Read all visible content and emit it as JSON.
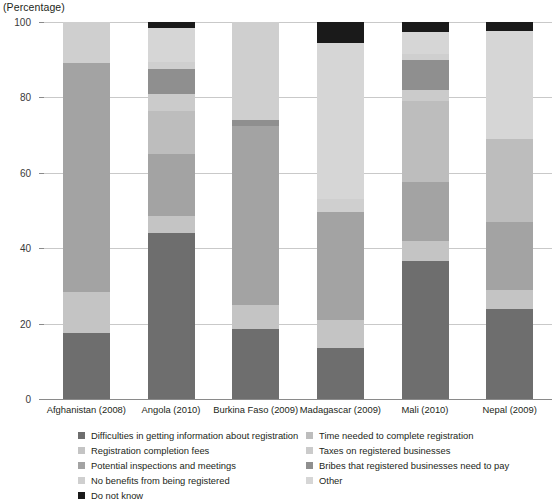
{
  "axis_unit_label": "(Percentage)",
  "legend": {
    "left_column": [
      {
        "label": "Difficulties in getting information about registration",
        "color": "#6e6e6e"
      },
      {
        "label": "Registration completion fees",
        "color": "#c4c4c4"
      },
      {
        "label": "Potential inspections and meetings",
        "color": "#a3a3a3"
      },
      {
        "label": "No benefits from being registered",
        "color": "#cfcfcf"
      },
      {
        "label": "Do not know",
        "color": "#1a1a1a"
      }
    ],
    "right_column": [
      {
        "label": "Time needed to complete registration",
        "color": "#bdbdbd"
      },
      {
        "label": "Taxes on registered businesses",
        "color": "#cbcbcb"
      },
      {
        "label": "Bribes that registered businesses need to pay",
        "color": "#8f8f8f"
      },
      {
        "label": "Other",
        "color": "#d6d6d6"
      }
    ]
  },
  "chart_data": {
    "type": "bar",
    "title": "",
    "subtitle": "",
    "xlabel": "",
    "ylabel": "(Percentage)",
    "ylim": [
      0,
      100
    ],
    "yticks": [
      0,
      20,
      40,
      60,
      80,
      100
    ],
    "grid": true,
    "stacked": true,
    "legend_position": "bottom",
    "categories": [
      "Afghanistan (2008)",
      "Angola (2010)",
      "Burkina Faso (2009)",
      "Madagascar (2009)",
      "Mali (2010)",
      "Nepal (2009)"
    ],
    "series": [
      {
        "name": "Difficulties in getting information about registration",
        "color": "#6e6e6e",
        "values": [
          17.5,
          44.0,
          18.5,
          13.5,
          36.5,
          24.0
        ]
      },
      {
        "name": "Registration completion fees",
        "color": "#c4c4c4",
        "values": [
          11.0,
          4.5,
          6.5,
          7.5,
          5.5,
          5.0
        ]
      },
      {
        "name": "Potential inspections and meetings",
        "color": "#a3a3a3",
        "values": [
          60.5,
          16.5,
          47.5,
          28.5,
          15.5,
          18.0
        ]
      },
      {
        "name": "Time needed to complete registration",
        "color": "#bdbdbd",
        "values": [
          0.0,
          11.5,
          0.0,
          0.0,
          21.5,
          22.0
        ]
      },
      {
        "name": "Taxes on registered businesses",
        "color": "#cbcbcb",
        "values": [
          0.0,
          4.5,
          0.0,
          0.0,
          3.0,
          0.0
        ]
      },
      {
        "name": "Bribes that registered businesses need to pay",
        "color": "#8f8f8f",
        "values": [
          0.0,
          6.5,
          1.5,
          0.0,
          8.0,
          0.0
        ]
      },
      {
        "name": "No benefits from being registered",
        "color": "#cfcfcf",
        "values": [
          11.0,
          2.0,
          26.0,
          3.5,
          1.5,
          0.0
        ]
      },
      {
        "name": "Other",
        "color": "#d6d6d6",
        "values": [
          0.0,
          9.0,
          0.0,
          41.5,
          6.0,
          28.5
        ]
      },
      {
        "name": "Do not know",
        "color": "#1a1a1a",
        "values": [
          0.0,
          1.5,
          0.0,
          5.5,
          2.5,
          2.5
        ]
      }
    ]
  }
}
